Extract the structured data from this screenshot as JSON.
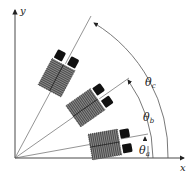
{
  "diagram": {
    "axes": {
      "x_label": "x",
      "y_label": "y"
    },
    "angles": [
      {
        "name": "theta_a",
        "symbol": "θ",
        "subscript": "a",
        "degrees": 10
      },
      {
        "name": "theta_b",
        "symbol": "θ",
        "subscript": "b",
        "degrees": 35
      },
      {
        "name": "theta_c",
        "symbol": "θ",
        "subscript": "c",
        "degrees": 62
      }
    ],
    "colors": {
      "line": "#555555",
      "body_hatch": "#6a6a6a",
      "block": "#111111",
      "background": "#ffffff"
    }
  }
}
